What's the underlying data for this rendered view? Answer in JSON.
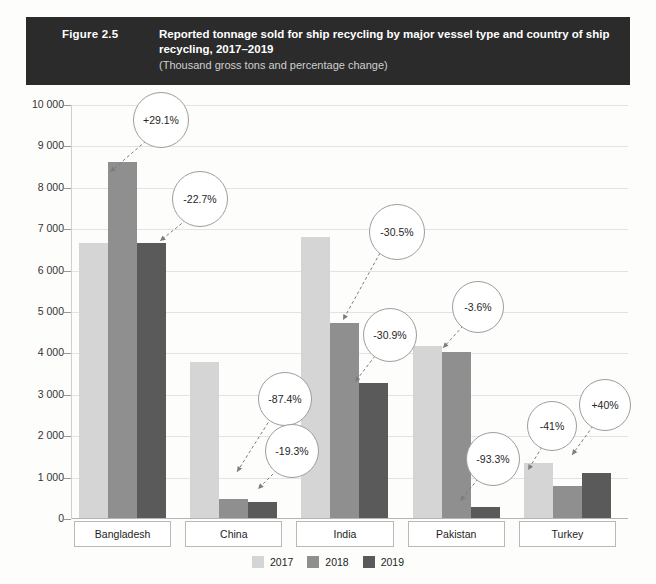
{
  "header": {
    "figure_number": "Figure 2.5",
    "title": "Reported tonnage sold for ship recycling by major vessel type and country of ship recycling, 2017–2019",
    "subtitle": "(Thousand gross tons and percentage change)"
  },
  "chart_data": {
    "type": "bar",
    "title": "Reported tonnage sold for ship recycling by major vessel type and country of ship recycling, 2017–2019",
    "subtitle": "(Thousand gross tons and percentage change)",
    "xlabel": "",
    "ylabel": "",
    "ylim": [
      0,
      10000
    ],
    "ytick_labels": [
      "0",
      "1 000",
      "2 000",
      "3 000",
      "4 000",
      "5 000",
      "6 000",
      "7 000",
      "8 000",
      "9 000",
      "10 000"
    ],
    "ytick_values": [
      0,
      1000,
      2000,
      3000,
      4000,
      5000,
      6000,
      7000,
      8000,
      9000,
      10000
    ],
    "grid": true,
    "legend_position": "bottom",
    "categories": [
      "Bangladesh",
      "China",
      "India",
      "Pakistan",
      "Turkey"
    ],
    "series": [
      {
        "name": "2017",
        "color": "#d5d5d5",
        "values": [
          6650,
          3760,
          6780,
          4150,
          1330
        ]
      },
      {
        "name": "2018",
        "color": "#8f8f8f",
        "values": [
          8590,
          470,
          4700,
          4000,
          780
        ]
      },
      {
        "name": "2019",
        "color": "#5a5a5a",
        "values": [
          6640,
          380,
          3250,
          270,
          1090
        ]
      }
    ],
    "annotations": [
      {
        "label": "+29.1%",
        "country": "Bangladesh",
        "series": "2018"
      },
      {
        "label": "-22.7%",
        "country": "Bangladesh",
        "series": "2019"
      },
      {
        "label": "-87.4%",
        "country": "China",
        "series": "2018"
      },
      {
        "label": "-19.3%",
        "country": "China",
        "series": "2019"
      },
      {
        "label": "-30.5%",
        "country": "India",
        "series": "2018"
      },
      {
        "label": "-30.9%",
        "country": "India",
        "series": "2019"
      },
      {
        "label": "-3.6%",
        "country": "Pakistan",
        "series": "2018"
      },
      {
        "label": "-93.3%",
        "country": "Pakistan",
        "series": "2019"
      },
      {
        "label": "-41%",
        "country": "Turkey",
        "series": "2018"
      },
      {
        "label": "+40%",
        "country": "Turkey",
        "series": "2019"
      }
    ]
  },
  "legend": [
    {
      "label": "2017",
      "color": "#d5d5d5"
    },
    {
      "label": "2018",
      "color": "#8f8f8f"
    },
    {
      "label": "2019",
      "color": "#5a5a5a"
    }
  ],
  "callout_positions": [
    {
      "label": "+29.1%",
      "cx": 160,
      "cy": 119,
      "r": 27,
      "x1": 146,
      "y1": 141,
      "x2": 110,
      "y2": 172
    },
    {
      "label": "-22.7%",
      "cx": 199,
      "cy": 198,
      "r": 27,
      "x1": 186,
      "y1": 220,
      "x2": 160,
      "y2": 241
    },
    {
      "label": "-87.4%",
      "cx": 284,
      "cy": 398,
      "r": 26,
      "x1": 271,
      "y1": 418,
      "x2": 237,
      "y2": 472
    },
    {
      "label": "-19.3%",
      "cx": 291,
      "cy": 450,
      "r": 26,
      "x1": 277,
      "y1": 470,
      "x2": 258,
      "y2": 489
    },
    {
      "label": "-30.5%",
      "cx": 396,
      "cy": 231,
      "r": 27,
      "x1": 380,
      "y1": 253,
      "x2": 343,
      "y2": 320
    },
    {
      "label": "-30.9%",
      "cx": 389,
      "cy": 334,
      "r": 26,
      "x1": 375,
      "y1": 356,
      "x2": 355,
      "y2": 382
    },
    {
      "label": "-3.6%",
      "cx": 477,
      "cy": 306,
      "r": 25,
      "x1": 463,
      "y1": 326,
      "x2": 443,
      "y2": 348
    },
    {
      "label": "-93.3%",
      "cx": 492,
      "cy": 458,
      "r": 26,
      "x1": 478,
      "y1": 479,
      "x2": 460,
      "y2": 501
    },
    {
      "label": "-41%",
      "cx": 551,
      "cy": 425,
      "r": 24,
      "x1": 542,
      "y1": 447,
      "x2": 528,
      "y2": 470
    },
    {
      "label": "+40%",
      "cx": 604,
      "cy": 404,
      "r": 25,
      "x1": 593,
      "y1": 426,
      "x2": 572,
      "y2": 455
    }
  ]
}
